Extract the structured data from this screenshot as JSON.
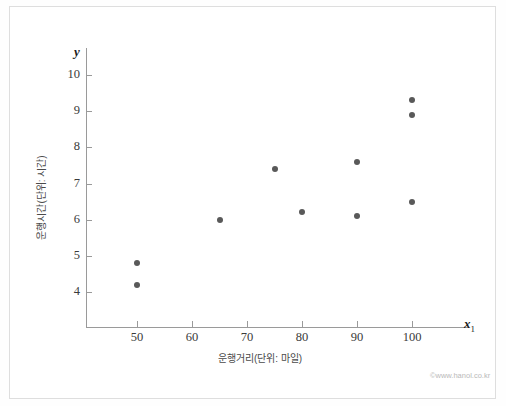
{
  "chart_data": {
    "type": "scatter",
    "title": "",
    "xlabel": "운행거리(단위: 마일)",
    "ylabel": "운행시간(단위: 시간)",
    "x_axis_symbol": "x",
    "x_axis_subscript": "1",
    "y_axis_symbol": "y",
    "xlim": [
      42,
      111
    ],
    "ylim": [
      3.4,
      10.6
    ],
    "grid": false,
    "legend": null,
    "xticks": [
      50,
      60,
      70,
      80,
      90,
      100
    ],
    "yticks": [
      4,
      5,
      6,
      7,
      8,
      9,
      10
    ],
    "points": [
      {
        "x": 50,
        "y": 4.8
      },
      {
        "x": 50,
        "y": 4.2
      },
      {
        "x": 65,
        "y": 6.0
      },
      {
        "x": 75,
        "y": 7.4
      },
      {
        "x": 80,
        "y": 6.2
      },
      {
        "x": 90,
        "y": 7.6
      },
      {
        "x": 90,
        "y": 6.1
      },
      {
        "x": 100,
        "y": 9.3
      },
      {
        "x": 100,
        "y": 8.9
      },
      {
        "x": 100,
        "y": 6.5
      }
    ],
    "marker_color": "#595959",
    "axis_color": "#9a9a9a"
  },
  "footer": {
    "watermark": "©www.hanol.co.kr"
  }
}
